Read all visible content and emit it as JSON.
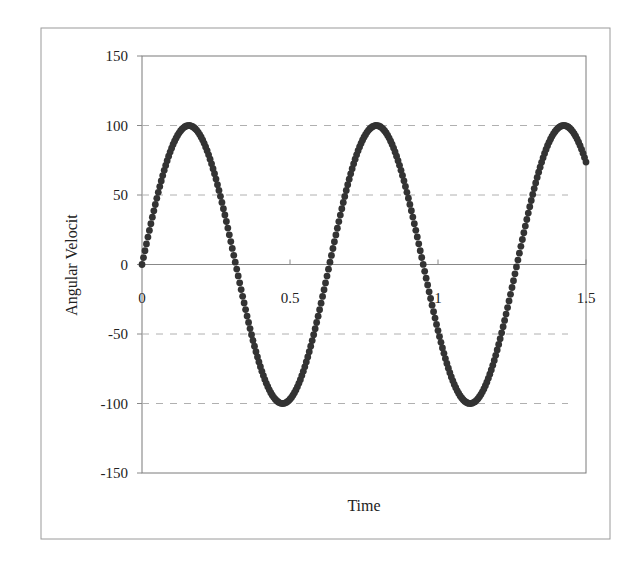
{
  "chart_data": {
    "type": "scatter",
    "title": "",
    "xlabel": "Time",
    "ylabel": "Angular Velocit",
    "xlim": [
      0,
      1.5
    ],
    "ylim": [
      -150,
      150
    ],
    "x_ticks": [
      "0",
      "0.5",
      "1",
      "1.5"
    ],
    "y_ticks": [
      "150",
      "100",
      "50",
      "0",
      "-50",
      "-100",
      "-150"
    ],
    "grid": {
      "horizontal": true,
      "style": "dashed",
      "values": [
        100,
        50,
        -50,
        -100
      ]
    },
    "legend": null,
    "series": [
      {
        "name": "Angular Velocity",
        "marker": "circle",
        "color": "#333333",
        "function": "100*sin(9.92*t)",
        "amplitude": 100,
        "omega": 9.92,
        "t_start": 0,
        "t_end": 1.5,
        "t_step": 0.005,
        "key_points": [
          {
            "x": 0,
            "y": 0
          },
          {
            "x": 0.155,
            "y": 100
          },
          {
            "x": 0.47,
            "y": -100
          },
          {
            "x": 0.79,
            "y": 100
          },
          {
            "x": 1.105,
            "y": -100
          },
          {
            "x": 1.43,
            "y": 100
          },
          {
            "x": 1.5,
            "y": 75
          }
        ]
      }
    ]
  },
  "colors": {
    "marker": "#333333",
    "frame": "#9a9a9a",
    "plot_border": "#7a7a7a",
    "grid": "#b0b0b0",
    "axis": "#888888"
  }
}
